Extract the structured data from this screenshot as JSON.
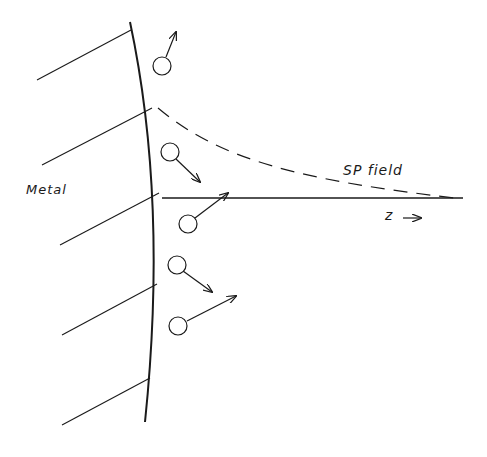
{
  "diagram": {
    "labels": {
      "metal": "Metal",
      "sp_field": "SP field",
      "z_axis": "z",
      "z_arrow": "→"
    },
    "colors": {
      "ink": "#1a1a1a",
      "background": "#ffffff"
    },
    "metal_surface": {
      "path": "M130,22 Q168,200 145,422"
    },
    "hatch_lines": [
      {
        "x1": 37,
        "y1": 80,
        "x2": 131,
        "y2": 30
      },
      {
        "x1": 42,
        "y1": 165,
        "x2": 152,
        "y2": 108
      },
      {
        "x1": 60,
        "y1": 245,
        "x2": 159,
        "y2": 193
      },
      {
        "x1": 62,
        "y1": 335,
        "x2": 157,
        "y2": 284
      },
      {
        "x1": 62,
        "y1": 425,
        "x2": 150,
        "y2": 378
      }
    ],
    "z_axis": {
      "x1": 162,
      "y1": 198,
      "x2": 463,
      "y2": 198
    },
    "sp_field_curve": {
      "path": "M158,108 C220,160 300,180 455,198"
    },
    "molecules": [
      {
        "cx": 162,
        "cy": 66,
        "r": 9,
        "arrow": {
          "x1": 166,
          "y1": 57,
          "x2": 176,
          "y2": 32
        }
      },
      {
        "cx": 170,
        "cy": 152,
        "r": 9,
        "arrow": {
          "x1": 176,
          "y1": 159,
          "x2": 200,
          "y2": 182
        }
      },
      {
        "cx": 188,
        "cy": 224,
        "r": 9,
        "arrow": {
          "x1": 195,
          "y1": 218,
          "x2": 228,
          "y2": 193
        }
      },
      {
        "cx": 177,
        "cy": 265,
        "r": 9,
        "arrow": {
          "x1": 183,
          "y1": 271,
          "x2": 212,
          "y2": 292
        }
      },
      {
        "cx": 178,
        "cy": 326,
        "r": 9,
        "arrow": {
          "x1": 187,
          "y1": 321,
          "x2": 236,
          "y2": 296
        }
      }
    ]
  }
}
